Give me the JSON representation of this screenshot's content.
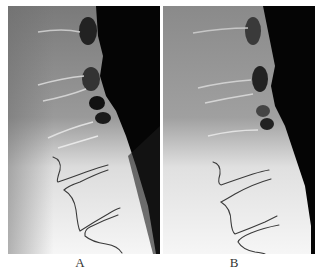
{
  "figure": {
    "panels": [
      {
        "id": "A",
        "label": "A",
        "description": "Lateral lumbar spine radiograph with traced vertebral outlines"
      },
      {
        "id": "B",
        "label": "B",
        "description": "Lateral lumbar spine radiograph with traced vertebral outlines"
      }
    ]
  },
  "colors": {
    "background": "#ffffff",
    "tracing": "#3a3a3a",
    "soft_tissue_dark": "#050505",
    "bone_gray": "#8a8a8a",
    "bright_area": "#f2f2f2"
  }
}
